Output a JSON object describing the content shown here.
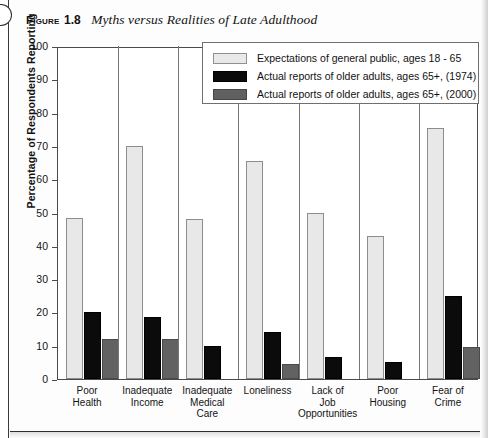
{
  "caption": {
    "figure_label": "Figure",
    "figure_number": "1.8",
    "title": "Myths versus Realities of Late Adulthood"
  },
  "legend": {
    "items": [
      {
        "label": "Expectations of general public, ages 18 -  65",
        "swatch": "light",
        "color": "#e9e9e9"
      },
      {
        "label": "Actual reports of older adults, ages 65+, (1974)",
        "swatch": "dark",
        "color": "#0a0a0a"
      },
      {
        "label": "Actual reports of older adults, ages 65+, (2000)",
        "swatch": "mid",
        "color": "#606060"
      }
    ]
  },
  "chart_data": {
    "type": "bar",
    "title": "Myths versus Realities of Late Adulthood",
    "xlabel": "",
    "ylabel": "Percentage of Respondents Reporting",
    "ylim": [
      0,
      100
    ],
    "ytick_step": 10,
    "yticks": [
      "0",
      "10",
      "20",
      "30",
      "40",
      "50",
      "60",
      "70",
      "80",
      "90",
      "100"
    ],
    "grid": false,
    "legend_position": "top-right-inside",
    "categories": [
      "Poor Health",
      "Inadequate Income",
      "Inadequate Medical Care",
      "Loneliness",
      "Lack of Job Opportunities",
      "Poor Housing",
      "Fear of Crime"
    ],
    "category_lines": [
      [
        "Poor",
        "Health"
      ],
      [
        "Inadequate",
        "Income"
      ],
      [
        "Inadequate",
        "Medical",
        "Care"
      ],
      [
        "Loneliness"
      ],
      [
        "Lack of",
        "Job",
        "Opportunities"
      ],
      [
        "Poor",
        "Housing"
      ],
      [
        "Fear of",
        "Crime"
      ]
    ],
    "series": [
      {
        "name": "Expectations of general public, ages 18 -  65",
        "color": "#e8e8e8",
        "values": [
          48.5,
          70,
          48,
          65.5,
          50,
          43,
          75.5
        ]
      },
      {
        "name": "Actual reports of older adults, ages 65+, (1974)",
        "color": "#0b0b0b",
        "values": [
          20,
          18.5,
          10,
          14,
          6.5,
          5,
          25
        ]
      },
      {
        "name": "Actual reports of older adults, ages 65+, (2000)",
        "color": "#626262",
        "values": [
          12,
          12,
          0,
          4.5,
          0,
          0,
          9.5
        ]
      }
    ]
  }
}
